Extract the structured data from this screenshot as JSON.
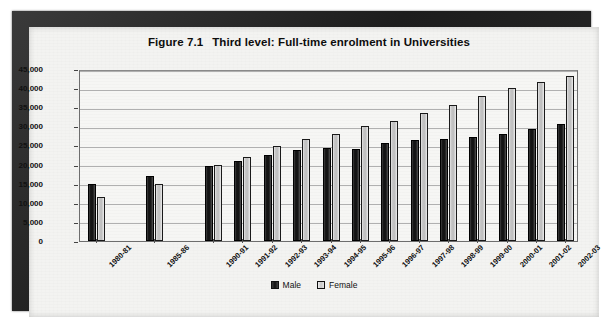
{
  "figure": {
    "number": "Figure 7.1",
    "title": "Third level: Full-time enrolment in Universities"
  },
  "legend": {
    "male_label": "Male",
    "female_label": "Female"
  },
  "chart_data": {
    "type": "bar",
    "xlabel": "",
    "ylabel": "",
    "ylim": [
      0,
      45000
    ],
    "ytick_labels": [
      "0",
      "5,000",
      "10,000",
      "15,000",
      "20,000",
      "25,000",
      "30,000",
      "35,000",
      "40,000",
      "45,000"
    ],
    "yticks": [
      0,
      5000,
      10000,
      15000,
      20000,
      25000,
      30000,
      35000,
      40000,
      45000
    ],
    "grid": true,
    "legend_position": "bottom-center",
    "categories": [
      "1980-81",
      "1985-86",
      "1990-91",
      "1991-92",
      "1992-93",
      "1993-94",
      "1994-95",
      "1995-96",
      "1996-97",
      "1997-98",
      "1998-99",
      "1999-00",
      "2000-01",
      "2001-02",
      "2002-03"
    ],
    "category_gaps_after": [
      "1980-81",
      "1985-86"
    ],
    "series": [
      {
        "name": "Male",
        "color": "#1a1a1a",
        "values": [
          15000,
          17000,
          19600,
          21000,
          22500,
          23800,
          24400,
          24100,
          25700,
          26300,
          26800,
          27300,
          28000,
          29300,
          30700
        ]
      },
      {
        "name": "Female",
        "color": "#c9c9c9",
        "values": [
          11500,
          15000,
          20000,
          22000,
          24800,
          26600,
          28000,
          30100,
          31400,
          33400,
          35700,
          38000,
          40000,
          41600,
          43200
        ]
      }
    ]
  }
}
